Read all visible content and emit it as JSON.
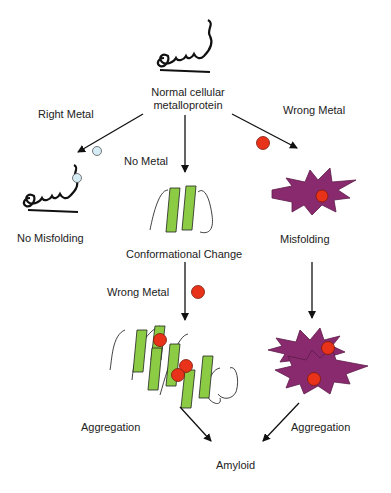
{
  "diagram": {
    "nodes": {
      "normal": {
        "label_line1": "Normal cellular",
        "label_line2": "metalloprotein"
      },
      "no_misfolding": {
        "label": "No Misfolding"
      },
      "conformational_change": {
        "label": "Conformational Change"
      },
      "misfolding": {
        "label": "Misfolding"
      },
      "aggregation_left": {
        "label": "Aggregation"
      },
      "aggregation_right": {
        "label": "Aggregation"
      },
      "amyloid": {
        "label": "Amyloid"
      }
    },
    "edges": {
      "right_metal": {
        "label": "Right Metal"
      },
      "no_metal": {
        "label": "No Metal"
      },
      "wrong_metal_top": {
        "label": "Wrong Metal"
      },
      "wrong_metal_middle": {
        "label": "Wrong Metal"
      }
    },
    "colors": {
      "right_metal_ion": "#d6ecf5",
      "wrong_metal_ion": "#e8321a",
      "beta_sheet": "#8ccc44",
      "misfolded_protein": "#8a2a6e",
      "line": "#111111"
    }
  }
}
